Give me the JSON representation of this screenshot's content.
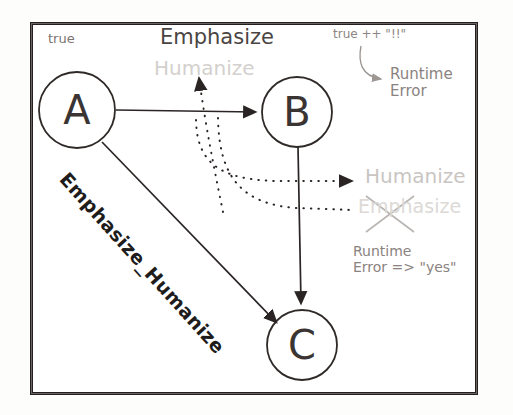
{
  "figure": {
    "type": "state-transition-diagram",
    "background_color": "#ffffff",
    "frame_color": "#241f1e"
  },
  "nodes": [
    {
      "id": "A",
      "label": "A",
      "cx": 77,
      "cy": 110,
      "r": 38
    },
    {
      "id": "B",
      "label": "B",
      "cx": 297,
      "cy": 112,
      "r": 35
    },
    {
      "id": "C",
      "label": "C",
      "cx": 302,
      "cy": 345,
      "r": 35
    }
  ],
  "edges": [
    {
      "from": "A",
      "to": "B",
      "style": "solid",
      "label": ""
    },
    {
      "from": "A",
      "to": "C",
      "style": "solid",
      "label": "Emphasize_Humanize"
    },
    {
      "from": "B",
      "to": "C",
      "style": "solid",
      "label": ""
    }
  ],
  "annotations": {
    "true_label": "true",
    "emphasize_top": "Emphasize",
    "humanize_ghost": "Humanize",
    "true_concat": "true ++ \"!!\"",
    "runtime_error_1": "Runtime\nError",
    "runtime_error_1_line1": "Runtime",
    "runtime_error_1_line2": "Error",
    "humanize_right": "Humanize",
    "emphasize_crossed": "Emphasize",
    "runtime_error_2_line1": "Runtime",
    "runtime_error_2_line2": "Error => \"yes\"",
    "diagonal_edge_label": "Emphasize_Humanize"
  },
  "colors": {
    "ink_dark": "#241f1e",
    "ink_mid": "#4a4543",
    "ink_faded": "#8a8380",
    "ink_ghost": "#d3d0cd",
    "paper": "#ffffff"
  }
}
